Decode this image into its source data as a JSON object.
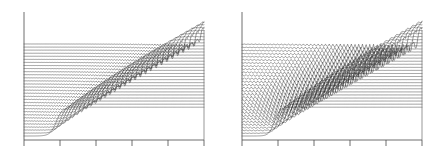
{
  "figure": {
    "title": "",
    "background_color": "#ffffff",
    "panel_count": 2,
    "line_color": "#1a1a1a",
    "axis_color": "#4a4a4a"
  },
  "chart_data": [
    {
      "type": "line",
      "panel": "left",
      "title": "",
      "xlabel": "",
      "ylabel": "",
      "xlim": [
        0,
        1
      ],
      "ylim": [
        0,
        1
      ],
      "grid": false,
      "legend": "none",
      "description": "Waterfall (stacked time-series) plot of a dispersive shock wave solution. Each curve is one time slice offset vertically; a smooth step front steepens and sheds dispersive oscillations forming a crosshatch envelope.",
      "xticks": [
        0.0,
        0.2,
        0.4,
        0.6,
        0.8,
        1.0
      ],
      "xticklabels": [
        "",
        "",
        "",
        "",
        "",
        ""
      ],
      "n_curves": 31,
      "curve_offset_y": 0.0295,
      "front_start_x": 0.18,
      "front_end_x": 0.98,
      "front_width": 0.035,
      "plateau_height": 0.6,
      "oscillation_amplitude": 0.085,
      "oscillation_wavelength": 0.03,
      "oscillation_damping": 2.1,
      "spike_depth_factor": 1.9,
      "series": [
        {
          "name": "t = 0",
          "offset": 0.0,
          "front_x": 0.18,
          "osc": 0.0
        },
        {
          "name": "t = 1",
          "offset": 0.029,
          "front_x": 0.205,
          "osc": 0.05
        },
        {
          "name": "t = 2",
          "offset": 0.059,
          "front_x": 0.228,
          "osc": 0.11
        },
        {
          "name": "t = 3",
          "offset": 0.088,
          "front_x": 0.251,
          "osc": 0.17
        },
        {
          "name": "t = 4",
          "offset": 0.118,
          "front_x": 0.275,
          "osc": 0.23
        },
        {
          "name": "t = 5",
          "offset": 0.147,
          "front_x": 0.299,
          "osc": 0.29
        },
        {
          "name": "t = 6",
          "offset": 0.177,
          "front_x": 0.323,
          "osc": 0.35
        },
        {
          "name": "t = 7",
          "offset": 0.206,
          "front_x": 0.348,
          "osc": 0.41
        },
        {
          "name": "t = 8",
          "offset": 0.236,
          "front_x": 0.373,
          "osc": 0.47
        },
        {
          "name": "t = 9",
          "offset": 0.265,
          "front_x": 0.398,
          "osc": 0.53
        },
        {
          "name": "t = 10",
          "offset": 0.295,
          "front_x": 0.424,
          "osc": 0.59
        },
        {
          "name": "t = 11",
          "offset": 0.324,
          "front_x": 0.45,
          "osc": 0.64
        },
        {
          "name": "t = 12",
          "offset": 0.354,
          "front_x": 0.476,
          "osc": 0.69
        },
        {
          "name": "t = 13",
          "offset": 0.383,
          "front_x": 0.503,
          "osc": 0.74
        },
        {
          "name": "t = 14",
          "offset": 0.413,
          "front_x": 0.53,
          "osc": 0.78
        },
        {
          "name": "t = 15",
          "offset": 0.442,
          "front_x": 0.557,
          "osc": 0.82
        },
        {
          "name": "t = 16",
          "offset": 0.472,
          "front_x": 0.585,
          "osc": 0.85
        },
        {
          "name": "t = 17",
          "offset": 0.501,
          "front_x": 0.613,
          "osc": 0.88
        },
        {
          "name": "t = 18",
          "offset": 0.531,
          "front_x": 0.641,
          "osc": 0.9
        },
        {
          "name": "t = 19",
          "offset": 0.56,
          "front_x": 0.67,
          "osc": 0.92
        },
        {
          "name": "t = 20",
          "offset": 0.59,
          "front_x": 0.699,
          "osc": 0.94
        },
        {
          "name": "t = 21",
          "offset": 0.619,
          "front_x": 0.728,
          "osc": 0.95
        },
        {
          "name": "t = 22",
          "offset": 0.649,
          "front_x": 0.757,
          "osc": 0.96
        },
        {
          "name": "t = 23",
          "offset": 0.678,
          "front_x": 0.787,
          "osc": 0.97
        },
        {
          "name": "t = 24",
          "offset": 0.708,
          "front_x": 0.817,
          "osc": 0.98
        },
        {
          "name": "t = 25",
          "offset": 0.737,
          "front_x": 0.847,
          "osc": 0.98
        },
        {
          "name": "t = 26",
          "offset": 0.767,
          "front_x": 0.877,
          "osc": 0.99
        },
        {
          "name": "t = 27",
          "offset": 0.796,
          "front_x": 0.907,
          "osc": 0.99
        },
        {
          "name": "t = 28",
          "offset": 0.826,
          "front_x": 0.937,
          "osc": 1.0
        },
        {
          "name": "t = 29",
          "offset": 0.855,
          "front_x": 0.967,
          "osc": 1.0
        },
        {
          "name": "t = 30",
          "offset": 0.885,
          "front_x": 0.997,
          "osc": 1.0
        }
      ]
    },
    {
      "type": "line",
      "panel": "right",
      "title": "",
      "xlabel": "",
      "ylabel": "",
      "xlim": [
        0,
        1
      ],
      "ylim": [
        0,
        1
      ],
      "grid": false,
      "legend": "none",
      "description": "Companion waterfall plot with the same stacked time slices but stronger, longer-wavelength dispersive oscillations producing deeper downward spikes behind the front.",
      "xticks": [
        0.0,
        0.2,
        0.4,
        0.6,
        0.8,
        1.0
      ],
      "xticklabels": [
        "",
        "",
        "",
        "",
        "",
        ""
      ],
      "n_curves": 31,
      "curve_offset_y": 0.0295,
      "front_start_x": 0.18,
      "front_end_x": 0.98,
      "front_width": 0.03,
      "plateau_height": 0.6,
      "oscillation_amplitude": 0.135,
      "oscillation_wavelength": 0.041,
      "oscillation_damping": 1.25,
      "spike_depth_factor": 2.6,
      "series": [
        {
          "name": "t = 0",
          "offset": 0.0,
          "front_x": 0.18,
          "osc": 0.0
        },
        {
          "name": "t = 1",
          "offset": 0.029,
          "front_x": 0.205,
          "osc": 0.05
        },
        {
          "name": "t = 2",
          "offset": 0.059,
          "front_x": 0.228,
          "osc": 0.11
        },
        {
          "name": "t = 3",
          "offset": 0.088,
          "front_x": 0.251,
          "osc": 0.17
        },
        {
          "name": "t = 4",
          "offset": 0.118,
          "front_x": 0.275,
          "osc": 0.23
        },
        {
          "name": "t = 5",
          "offset": 0.147,
          "front_x": 0.299,
          "osc": 0.29
        },
        {
          "name": "t = 6",
          "offset": 0.177,
          "front_x": 0.323,
          "osc": 0.35
        },
        {
          "name": "t = 7",
          "offset": 0.206,
          "front_x": 0.348,
          "osc": 0.41
        },
        {
          "name": "t = 8",
          "offset": 0.236,
          "front_x": 0.373,
          "osc": 0.47
        },
        {
          "name": "t = 9",
          "offset": 0.265,
          "front_x": 0.398,
          "osc": 0.53
        },
        {
          "name": "t = 10",
          "offset": 0.295,
          "front_x": 0.424,
          "osc": 0.59
        },
        {
          "name": "t = 11",
          "offset": 0.324,
          "front_x": 0.45,
          "osc": 0.64
        },
        {
          "name": "t = 12",
          "offset": 0.354,
          "front_x": 0.476,
          "osc": 0.69
        },
        {
          "name": "t = 13",
          "offset": 0.383,
          "front_x": 0.503,
          "osc": 0.74
        },
        {
          "name": "t = 14",
          "offset": 0.413,
          "front_x": 0.53,
          "osc": 0.78
        },
        {
          "name": "t = 15",
          "offset": 0.442,
          "front_x": 0.557,
          "osc": 0.82
        },
        {
          "name": "t = 16",
          "offset": 0.472,
          "front_x": 0.585,
          "osc": 0.85
        },
        {
          "name": "t = 17",
          "offset": 0.501,
          "front_x": 0.613,
          "osc": 0.88
        },
        {
          "name": "t = 18",
          "offset": 0.531,
          "front_x": 0.641,
          "osc": 0.9
        },
        {
          "name": "t = 19",
          "offset": 0.56,
          "front_x": 0.67,
          "osc": 0.92
        },
        {
          "name": "t = 20",
          "offset": 0.59,
          "front_x": 0.699,
          "osc": 0.94
        },
        {
          "name": "t = 21",
          "offset": 0.619,
          "front_x": 0.728,
          "osc": 0.95
        },
        {
          "name": "t = 22",
          "offset": 0.649,
          "front_x": 0.757,
          "osc": 0.96
        },
        {
          "name": "t = 23",
          "offset": 0.678,
          "front_x": 0.787,
          "osc": 0.97
        },
        {
          "name": "t = 24",
          "offset": 0.708,
          "front_x": 0.817,
          "osc": 0.98
        },
        {
          "name": "t = 25",
          "offset": 0.737,
          "front_x": 0.847,
          "osc": 0.98
        },
        {
          "name": "t = 26",
          "offset": 0.767,
          "front_x": 0.877,
          "osc": 0.99
        },
        {
          "name": "t = 27",
          "offset": 0.796,
          "front_x": 0.907,
          "osc": 0.99
        },
        {
          "name": "t = 28",
          "offset": 0.826,
          "front_x": 0.937,
          "osc": 1.0
        },
        {
          "name": "t = 29",
          "offset": 0.855,
          "front_x": 0.967,
          "osc": 1.0
        },
        {
          "name": "t = 30",
          "offset": 0.885,
          "front_x": 0.997,
          "osc": 1.0
        }
      ]
    }
  ]
}
